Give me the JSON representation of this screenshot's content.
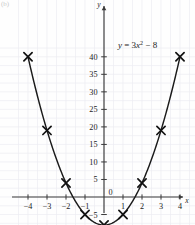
{
  "corner": {
    "label": "(b)"
  },
  "chart_data": {
    "type": "scatter",
    "title": "",
    "subtitle": "",
    "annotation": "y = 3x² − 8",
    "equation_parts": {
      "lhs": "y",
      "equals": "=",
      "coefficient": "3",
      "variable": "x",
      "exponent": "2",
      "minus": "−",
      "constant": "8"
    },
    "xlabel": "x",
    "ylabel": "y",
    "xlim": [
      -4.9,
      4.9
    ],
    "ylim": [
      -12.5,
      43.5
    ],
    "xticks": [
      -4,
      -3,
      -2,
      -1,
      0,
      1,
      2,
      3,
      4
    ],
    "xtick_labels": [
      "−4",
      "−3",
      "−2",
      "−1",
      "0",
      "1",
      "2",
      "3",
      "4"
    ],
    "yticks": [
      -10,
      -5,
      5,
      10,
      15,
      20,
      25,
      30,
      35,
      40
    ],
    "ytick_labels": [
      "−10",
      "−5",
      "5",
      "10",
      "15",
      "20",
      "25",
      "30",
      "35",
      "40"
    ],
    "origin_label": "0",
    "grid": true,
    "grid_step_x": 0.5,
    "grid_step_y": 2.5,
    "marker": "cross",
    "x": [
      -4,
      -3,
      -2,
      -1,
      0,
      1,
      2,
      3,
      4
    ],
    "values": [
      40,
      19,
      4,
      -5,
      -8,
      -5,
      4,
      19,
      40
    ],
    "curve_label": "y = 3x² − 8",
    "legend": [],
    "colors": {
      "curve": "#1a1a1a",
      "axis": "#3b3b3b",
      "grid": "#ededf2",
      "marker": "#111111",
      "text": "#1c1c1c",
      "background": "#fefefe"
    }
  }
}
